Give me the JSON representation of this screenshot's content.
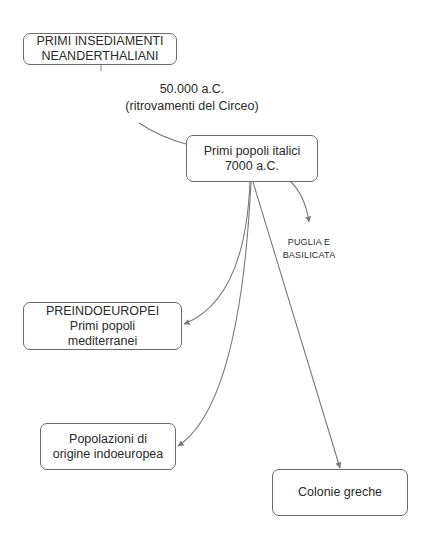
{
  "diagram": {
    "type": "concept-map",
    "colors": {
      "background": "#ffffff",
      "node_border": "#6b6b6b",
      "connector": "#7a7a7a",
      "text": "#2a2a2a"
    },
    "nodes": {
      "neanderthal": {
        "line1": "PRIMI INSEDIAMENTI",
        "line2": "NEANDERTHALIANI"
      },
      "central": {
        "line1": "Primi popoli italici",
        "line2": "7000 a.C."
      },
      "preindoeuropei": {
        "line1": "PREINDOEUROPEI",
        "line2": "Primi popoli",
        "line3": "mediterranei"
      },
      "indoeuropei": {
        "line1": "Popolazioni di",
        "line2": "origine indoeuropea"
      },
      "colonie": {
        "line1": "Colonie greche"
      }
    },
    "labels": {
      "date": {
        "line1": "50.000 a.C.",
        "line2": "(ritrovamenti del Circeo)"
      },
      "region": {
        "line1": "PUGLIA E",
        "line2": "BASILICATA"
      }
    },
    "edges": [
      {
        "from": "neanderthal",
        "to": "date_label",
        "arrow": false
      },
      {
        "from": "date_label",
        "to": "central",
        "arrow": false
      },
      {
        "from": "central",
        "to": "region_label",
        "arrow": true
      },
      {
        "from": "central",
        "to": "preindoeuropei",
        "arrow": true
      },
      {
        "from": "central",
        "to": "indoeuropei",
        "arrow": true
      },
      {
        "from": "central",
        "to": "colonie",
        "arrow": true
      }
    ]
  }
}
